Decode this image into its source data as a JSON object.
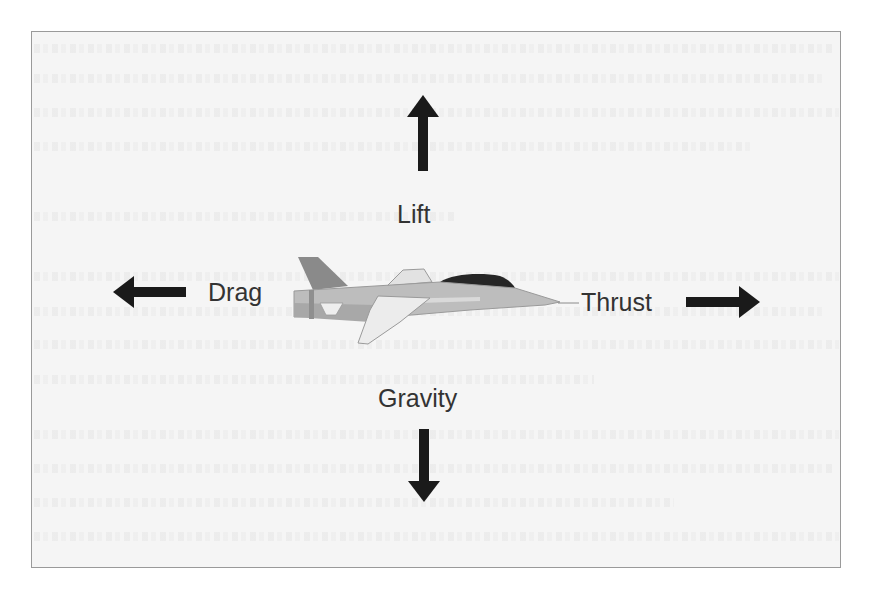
{
  "diagram": {
    "colors": {
      "background": "#f5f5f5",
      "frame_border": "#9a9a9a",
      "arrow": "#1a1a1a",
      "label_text": "#333333",
      "jet_body": "#bdbdbd",
      "jet_tail": "#8a8a8a",
      "jet_wing": "#ececec",
      "jet_canopy": "#262626"
    },
    "forces": [
      {
        "name": "lift",
        "label": "Lift",
        "direction": "up",
        "icon": "arrow-up-icon"
      },
      {
        "name": "drag",
        "label": "Drag",
        "direction": "left",
        "icon": "arrow-left-icon"
      },
      {
        "name": "thrust",
        "label": "Thrust",
        "direction": "right",
        "icon": "arrow-right-icon"
      },
      {
        "name": "gravity",
        "label": "Gravity",
        "direction": "down",
        "icon": "arrow-down-icon"
      }
    ]
  }
}
